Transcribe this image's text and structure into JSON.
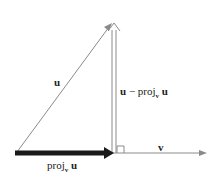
{
  "diagram": {
    "labels": {
      "u": "u",
      "diff_u": "u",
      "diff_minus": " − proj",
      "diff_sub": "v",
      "diff_u2": " u",
      "v": "v",
      "proj": "proj",
      "proj_sub": "v",
      "proj_u": " u"
    },
    "colors": {
      "line": "#8a8a8a",
      "proj_arrow": "#1a1a1a",
      "text": "#222222"
    }
  }
}
